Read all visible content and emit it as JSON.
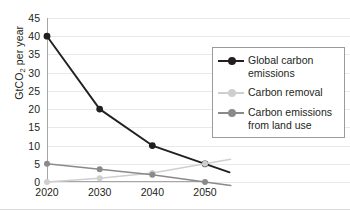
{
  "chart_data": {
    "type": "line",
    "title": "",
    "subtitle": "",
    "xlabel": "",
    "ylabel": "GtCO2 per year",
    "ylabel_parts": {
      "pre": "GtCO",
      "sub": "2",
      "post": " per year"
    },
    "categories": [
      "2020",
      "2030",
      "2040",
      "2050"
    ],
    "x": [
      2020,
      2030,
      2040,
      2050
    ],
    "xlim": [
      2020,
      2050
    ],
    "ylim": [
      0,
      45
    ],
    "yticks": [
      0,
      5,
      10,
      15,
      20,
      25,
      30,
      35,
      40,
      45
    ],
    "xticks": [
      "2020",
      "2030",
      "2040",
      "2050"
    ],
    "grid": "horizontal",
    "legend_position": "right",
    "series": [
      {
        "name": "Global carbon emissions",
        "label_lines": [
          "Global carbon",
          "emissions"
        ],
        "color": "#231f20",
        "values": [
          40,
          20,
          10,
          5
        ]
      },
      {
        "name": "Carbon removal",
        "label_lines": [
          "Carbon removal"
        ],
        "color": "#cfcfcf",
        "values": [
          0,
          1,
          2.5,
          5
        ]
      },
      {
        "name": "Carbon emissions from land use",
        "label_lines": [
          "Carbon emissions",
          "from land use"
        ],
        "color": "#8a8a8a",
        "values": [
          5,
          3.5,
          2,
          0
        ]
      }
    ]
  },
  "colors": {
    "axis": "#a6a6a6",
    "grid": "#e9e9e9",
    "text": "#231f20",
    "legend_border": "#9b9b9b",
    "background": "#ffffff"
  }
}
